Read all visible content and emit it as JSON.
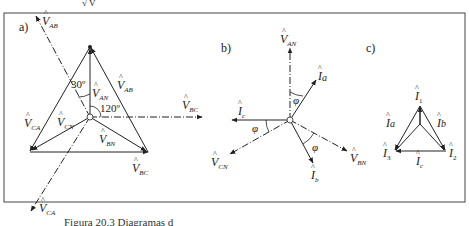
{
  "figure": {
    "caption_partial": "Figura 20.3  Diagramas d",
    "top_fragment": "√ V",
    "panels": {
      "a": {
        "label": "a)",
        "angle_30": "30º",
        "angle_120": "120º",
        "labels": {
          "V_AB_dashed": {
            "base": "V",
            "sub": "AB"
          },
          "V_AB_side": {
            "base": "V",
            "sub": "AB"
          },
          "V_AN": {
            "base": "V",
            "sub": "AN"
          },
          "V_CN": {
            "base": "V",
            "sub": "CN"
          },
          "V_CA_side": {
            "base": "V",
            "sub": "CA"
          },
          "V_BN": {
            "base": "V",
            "sub": "BN"
          },
          "V_BC_side": {
            "base": "V",
            "sub": "BC"
          },
          "V_BC_dashed": {
            "base": "V",
            "sub": "BC"
          },
          "V_CA_dashed": {
            "base": "V",
            "sub": "CA"
          }
        }
      },
      "b": {
        "label": "b)",
        "phi": "φ",
        "labels": {
          "V_AN": {
            "base": "V",
            "sub": "AN"
          },
          "I_a": {
            "base": "I",
            "sub": "a"
          },
          "I_c": {
            "base": "I",
            "sub": "c"
          },
          "V_CN": {
            "base": "V",
            "sub": "CN"
          },
          "I_b": {
            "base": "I",
            "sub": "b"
          },
          "V_BN": {
            "base": "V",
            "sub": "BN"
          }
        }
      },
      "c": {
        "label": "c)",
        "labels": {
          "I_1": {
            "base": "I",
            "sub": "1"
          },
          "I_2": {
            "base": "I",
            "sub": "2"
          },
          "I_3": {
            "base": "I",
            "sub": "3"
          },
          "I_a": {
            "base": "I",
            "sub": "a"
          },
          "I_b": {
            "base": "I",
            "sub": "b"
          },
          "I_c": {
            "base": "I",
            "sub": "c"
          }
        }
      }
    },
    "colors": {
      "line": "#222222",
      "frame": "#444444",
      "background": "#ffffff"
    }
  }
}
